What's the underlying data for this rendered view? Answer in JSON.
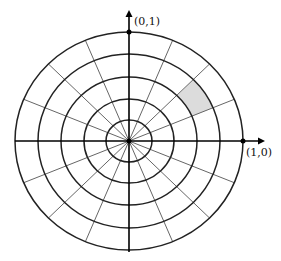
{
  "diagram": {
    "type": "polar-grid",
    "center": {
      "x": 129,
      "y": 141
    },
    "rings": {
      "count": 5,
      "rx": [
        23,
        45,
        68,
        91,
        114
      ],
      "ry": [
        21,
        42,
        64,
        87,
        109
      ],
      "color": "#222222"
    },
    "spokes": {
      "count": 16,
      "step_degrees": 22.5,
      "color": "#666666"
    },
    "axes": {
      "color": "#000000",
      "x_axis": {
        "from": 15,
        "to": 265
      },
      "y_axis": {
        "from": 252,
        "to": 10
      }
    },
    "shaded_cell": {
      "ring_inner": 3,
      "ring_outer": 4,
      "angle_start_deg": 22.5,
      "angle_end_deg": 45,
      "fill": "#dcdcdc"
    },
    "points": [
      {
        "label": "(0,1)",
        "x": 129,
        "y": 32
      },
      {
        "label": "(1,0)",
        "x": 243,
        "y": 141
      }
    ]
  },
  "labels": {
    "top_point": "(0,1)",
    "right_point": "(1,0)"
  }
}
